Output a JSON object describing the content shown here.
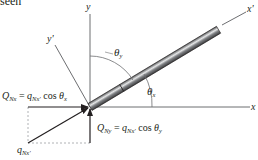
{
  "header_fragment": "seen",
  "axes": {
    "x_label": "x",
    "y_label": "y",
    "x_prime_label": "x'",
    "y_prime_label": "y'"
  },
  "angles": {
    "theta_x": {
      "symbol": "θ",
      "sub": "x"
    },
    "theta_y": {
      "symbol": "θ",
      "sub": "y"
    }
  },
  "equations": {
    "q_nx": {
      "lhs_sym": "Q",
      "lhs_sub": "Nx",
      "eq": " = ",
      "rhs_sym": "q",
      "rhs_sub": "Nx'",
      "func": " cos ",
      "theta": "θ",
      "theta_sub": "x"
    },
    "q_ny": {
      "lhs_sym": "Q",
      "lhs_sub": "Ny",
      "eq": " = ",
      "rhs_sym": "q",
      "rhs_sub": "Nx'",
      "func": " cos ",
      "theta": "θ",
      "theta_sub": "y"
    }
  },
  "resultant": {
    "sym": "q",
    "sub": "Nx'"
  },
  "colors": {
    "line": "#231f20",
    "axis": "#6d6e71",
    "dashed": "#9d9fa2",
    "bar_dark": "#4d4d4f",
    "bar_light": "#d1d3d4"
  }
}
